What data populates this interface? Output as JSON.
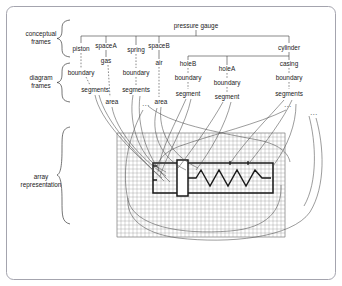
{
  "figure": {
    "side_labels": [
      {
        "id": "conceptual-frames",
        "line1": "conceptual",
        "line2": "frames"
      },
      {
        "id": "diagram-frames",
        "line1": "diagram",
        "line2": "frames"
      },
      {
        "id": "array-representation",
        "line1": "array",
        "line2": "representation"
      }
    ],
    "root": {
      "id": "pressure-gauge",
      "label": "pressure gauge"
    },
    "conceptual_nodes": [
      {
        "id": "piston",
        "label": "piston"
      },
      {
        "id": "spacea",
        "label": "spaceA"
      },
      {
        "id": "gas",
        "label": "gas"
      },
      {
        "id": "spring",
        "label": "spring"
      },
      {
        "id": "spaceb",
        "label": "spaceB"
      },
      {
        "id": "air",
        "label": "air"
      },
      {
        "id": "cylinder",
        "label": "cylinder"
      },
      {
        "id": "holeb",
        "label": "holeB"
      },
      {
        "id": "holea",
        "label": "holeA"
      },
      {
        "id": "casing",
        "label": "casing"
      }
    ],
    "diagram_nodes": [
      {
        "id": "piston-boundary",
        "label": "boundary"
      },
      {
        "id": "piston-segments",
        "label": "segments"
      },
      {
        "id": "gas-area",
        "label": "area"
      },
      {
        "id": "spring-boundary",
        "label": "boundary"
      },
      {
        "id": "spring-segments",
        "label": "segments"
      },
      {
        "id": "air-area",
        "label": "area"
      },
      {
        "id": "holeb-boundary",
        "label": "boundary"
      },
      {
        "id": "holeb-segment",
        "label": "segment"
      },
      {
        "id": "holea-boundary",
        "label": "boundary"
      },
      {
        "id": "holea-segment",
        "label": "segment"
      },
      {
        "id": "casing-boundary",
        "label": "boundary"
      },
      {
        "id": "casing-segments",
        "label": "segments"
      }
    ],
    "ellipses": [
      {
        "id": "ellipsis-spring-segments",
        "label": "..."
      },
      {
        "id": "ellipsis-casing-segments",
        "label": "..."
      },
      {
        "id": "ellipsis-casing-segments-2",
        "label": "..."
      }
    ],
    "colors": {
      "ink": "#1a1a1a",
      "edge": "#3a3a3a",
      "link": "#4a4a4a",
      "grid": "#8a8a8a",
      "frame_border": "#9a9aa5",
      "background": "#ffffff"
    },
    "array": {
      "id": "pixel-grid",
      "columns": 42,
      "rows": 26,
      "cell_size": 4
    }
  }
}
